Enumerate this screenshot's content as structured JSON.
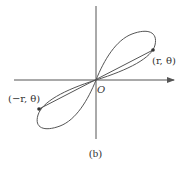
{
  "figure": {
    "caption": "(b)",
    "origin_label": "O",
    "point_positive_label": "(r, θ)",
    "point_negative_label": "(−r, θ)",
    "colors": {
      "stroke": "#555555",
      "text": "#333333",
      "background": "#ffffff"
    }
  }
}
